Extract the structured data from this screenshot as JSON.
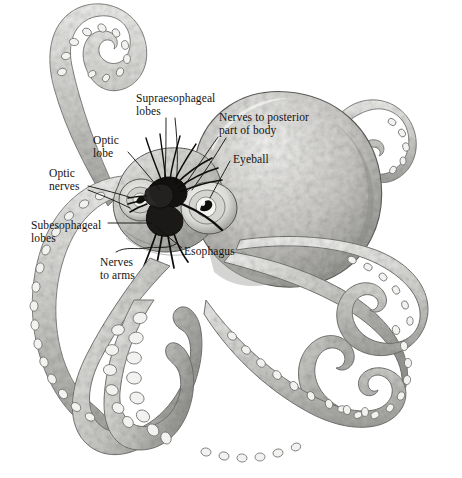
{
  "figure": {
    "style": "grayscale pencil / stipple scientific illustration",
    "background_color": "#ffffff",
    "label_color": "#16130f",
    "leader_line_color": "#100d0a",
    "width": 462,
    "height": 478
  },
  "labels": [
    {
      "id": "supraesophageal-lobes",
      "text": "Supraesophageal\nlobes"
    },
    {
      "id": "nerves-to-posterior-part-of-body",
      "text": "Nerves to posterior\npart of body"
    },
    {
      "id": "eyeball",
      "text": "Eyeball"
    },
    {
      "id": "optic-lobe",
      "text": "Optic\nlobe"
    },
    {
      "id": "optic-nerves",
      "text": "Optic\nnerves"
    },
    {
      "id": "subesophageal-lobes",
      "text": "Subesophageal\nlobes"
    },
    {
      "id": "esophagus",
      "text": "Esophagus"
    },
    {
      "id": "nerves-to-arms",
      "text": "Nerves\nto arms"
    }
  ],
  "palette": {
    "body_light": "#e8e8e6",
    "body_mid": "#c9c9c6",
    "body_dark": "#9b9b98",
    "body_shadow": "#6f6f6d",
    "outline": "#5a5a58",
    "nerve_black": "#0d0c0a",
    "sucker_light": "#f2f2f0",
    "white": "#ffffff"
  }
}
